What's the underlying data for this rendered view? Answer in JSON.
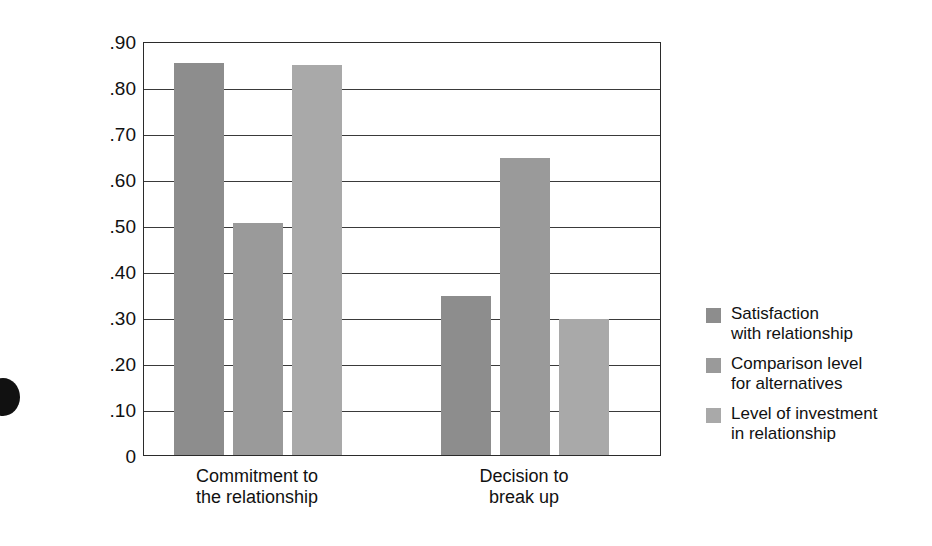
{
  "chart_data": {
    "type": "bar",
    "title": "",
    "subtitle": "",
    "xlabel": "",
    "ylabel": "Degree of contribution",
    "ylim": [
      0,
      0.9
    ],
    "grid": true,
    "legend_position": "right",
    "categories": [
      "Commitment to\nthe relationship",
      "Decision to\nbreak up"
    ],
    "tick_labels": [
      ".90",
      ".80",
      ".70",
      ".60",
      ".50",
      ".40",
      ".30",
      ".20",
      ".10",
      "0"
    ],
    "tick_values": [
      0.9,
      0.8,
      0.7,
      0.6,
      0.5,
      0.4,
      0.3,
      0.2,
      0.1,
      0
    ],
    "series": [
      {
        "name": "Satisfaction\nwith relationship",
        "color": "#8d8d8d",
        "values": [
          0.853,
          0.345
        ]
      },
      {
        "name": "Comparison level\nfor alternatives",
        "color": "#9a9a9a",
        "values": [
          0.505,
          0.645
        ]
      },
      {
        "name": "Level of investment\nin relationship",
        "color": "#a9a9a9",
        "values": [
          0.847,
          0.295
        ]
      }
    ]
  },
  "axis": {
    "y_title": "Degree of contribution"
  },
  "legend": {
    "items": [
      {
        "label": "Satisfaction\nwith relationship",
        "color": "#8d8d8d"
      },
      {
        "label": "Comparison level\nfor alternatives",
        "color": "#9a9a9a"
      },
      {
        "label": "Level of investment\nin relationship",
        "color": "#a9a9a9"
      }
    ]
  },
  "categories": [
    {
      "label": "Commitment to\nthe relationship"
    },
    {
      "label": "Decision to\nbreak up"
    }
  ],
  "y_ticks": [
    {
      "label": ".90"
    },
    {
      "label": ".80"
    },
    {
      "label": ".70"
    },
    {
      "label": ".60"
    },
    {
      "label": ".50"
    },
    {
      "label": ".40"
    },
    {
      "label": ".30"
    },
    {
      "label": ".20"
    },
    {
      "label": ".10"
    },
    {
      "label": "0"
    }
  ]
}
